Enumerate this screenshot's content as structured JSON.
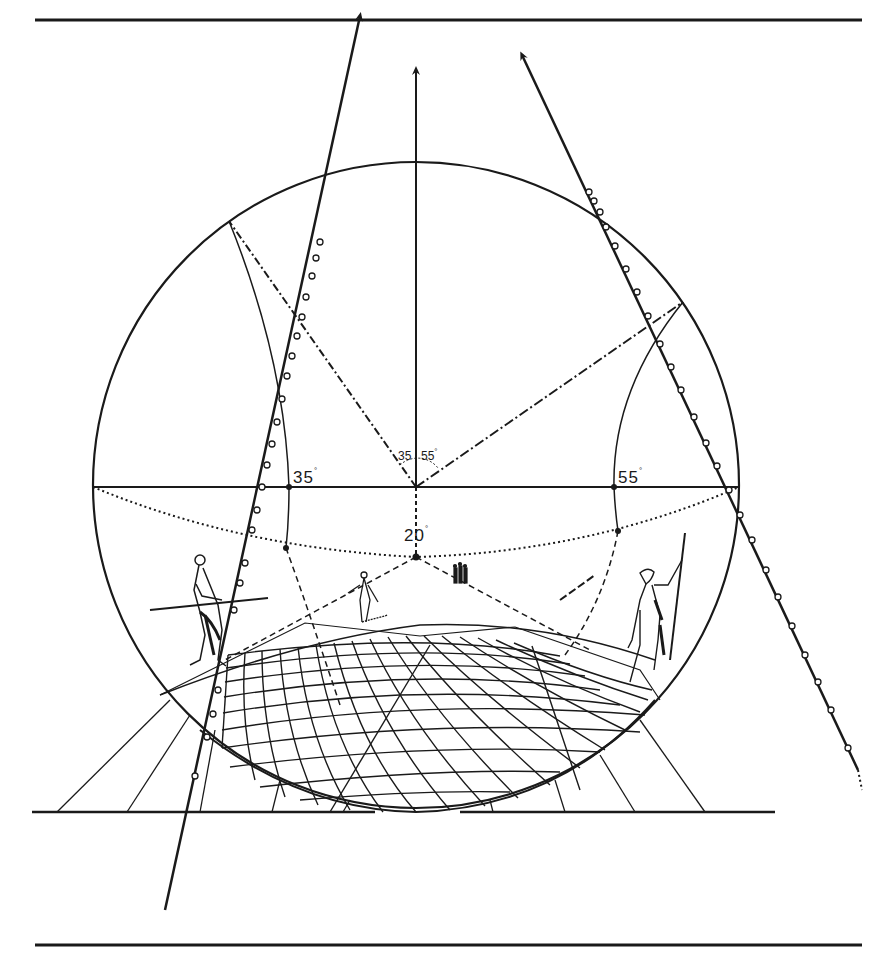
{
  "figure": {
    "type": "curvilinear-perspective-diagram",
    "colors": {
      "ink": "#1a1a1a",
      "paper": "#ffffff"
    },
    "labels": {
      "left_angle": "35",
      "right_angle": "55",
      "down_angle": "20",
      "center_left_angle": "35",
      "center_right_angle": "55",
      "degree_symbol": "°"
    },
    "figures": [
      {
        "name": "tightrope-walker-with-pole",
        "position": "left"
      },
      {
        "name": "walking-figure-center",
        "position": "center"
      },
      {
        "name": "group-of-three-figures",
        "position": "center-right"
      },
      {
        "name": "standing-man-with-staff",
        "position": "right"
      }
    ],
    "elements": {
      "circle": "fisheye-projection-circle",
      "horizon": "horizon-line",
      "grid": "curved-ground-grid",
      "axes": [
        "vertical-axis-arrow",
        "left-ray-arrow",
        "right-ray-arrow"
      ]
    }
  }
}
